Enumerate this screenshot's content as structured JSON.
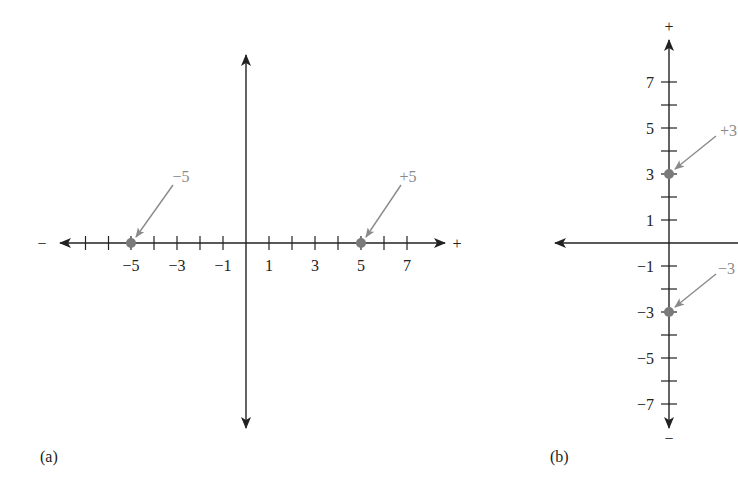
{
  "panels": {
    "a": {
      "caption": "(a)",
      "neg_sign": "−",
      "pos_sign": "+",
      "ticks": [
        "−5",
        "−3",
        "−1",
        "1",
        "3",
        "5",
        "7"
      ],
      "points": [
        {
          "label": "−5",
          "value": -5
        },
        {
          "label": "+5",
          "value": 5
        }
      ]
    },
    "b": {
      "caption": "(b)",
      "top_sign": "+",
      "bottom_sign": "−",
      "ticks_pos": [
        "7",
        "5",
        "3",
        "1"
      ],
      "ticks_neg": [
        "−1",
        "−3",
        "−5",
        "−7"
      ],
      "points": [
        {
          "label": "+3",
          "value": 3
        },
        {
          "label": "−3",
          "value": -3
        }
      ]
    }
  },
  "colors": {
    "axis": "#222222",
    "point": "#7a7a7a",
    "annotation": "#8a8a8a"
  }
}
